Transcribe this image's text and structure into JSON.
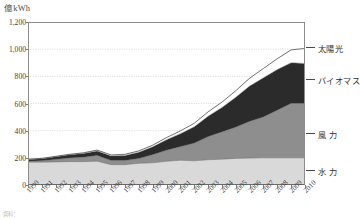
{
  "chart_data": {
    "type": "area",
    "title": "",
    "subtitle": "",
    "xlabel": "",
    "ylabel": "億kWh",
    "unit_label": "億kWh",
    "stacked": true,
    "grid": true,
    "legend_position": "right-inline",
    "ylim": [
      0,
      1200
    ],
    "yticks": [
      "0",
      "200",
      "400",
      "600",
      "800",
      "1,000",
      "1,200"
    ],
    "ytick_values": [
      0,
      200,
      400,
      600,
      800,
      1000,
      1200
    ],
    "categories": [
      "1990",
      "1991",
      "1992",
      "1993",
      "1994",
      "1995",
      "1996",
      "1997",
      "1998",
      "1999",
      "2000",
      "2001",
      "2002",
      "2003",
      "2004",
      "2005",
      "2006",
      "2007",
      "2008",
      "2009",
      "2010"
    ],
    "series": [
      {
        "name": "水力",
        "label": "水 力",
        "color": "#d9d9d9",
        "values": [
          168,
          168,
          170,
          172,
          172,
          175,
          150,
          150,
          160,
          163,
          175,
          182,
          178,
          186,
          190,
          196,
          198,
          200,
          200,
          200,
          200
        ]
      },
      {
        "name": "風力",
        "label": "風 力",
        "color": "#8e8e8e",
        "values": [
          6,
          10,
          18,
          26,
          32,
          42,
          30,
          30,
          35,
          60,
          80,
          100,
          130,
          170,
          200,
          230,
          270,
          300,
          350,
          400,
          400
        ]
      },
      {
        "name": "バイオマス",
        "label": "バイオマス",
        "color": "#2b2b2b",
        "values": [
          14,
          16,
          20,
          24,
          28,
          34,
          34,
          38,
          46,
          58,
          78,
          96,
          120,
          150,
          180,
          220,
          260,
          290,
          300,
          300,
          295
        ]
      },
      {
        "name": "太陽光",
        "label": "太陽光",
        "color": "#ffffff",
        "values": [
          2,
          2,
          3,
          4,
          5,
          6,
          7,
          8,
          10,
          12,
          16,
          20,
          26,
          32,
          40,
          48,
          58,
          68,
          80,
          95,
          110
        ]
      }
    ],
    "totals": [
      190,
      196,
      211,
      226,
      237,
      257,
      221,
      226,
      251,
      293,
      349,
      398,
      454,
      538,
      610,
      694,
      786,
      858,
      930,
      995,
      1005
    ],
    "annotations": []
  },
  "labels": {
    "footnote": "資料："
  }
}
